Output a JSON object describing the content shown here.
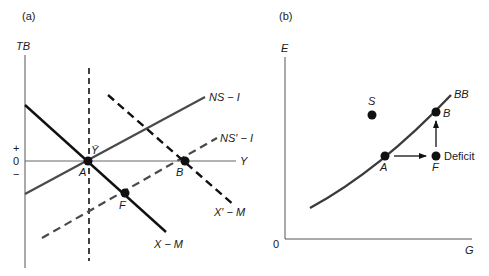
{
  "panel_a": {
    "label": "(a)",
    "y_axis_label": "TB",
    "x_axis_label": "Y",
    "tick_plus": "+",
    "tick_zero": "0",
    "tick_minus": "−",
    "ybar_label": "Ȳ",
    "curves": {
      "ns_i": "NS − I",
      "ns_prime_i": "NS′ − I",
      "x_m": "X − M",
      "x_prime_m": "X′ − M"
    },
    "points": {
      "a": "A",
      "b": "B",
      "f": "F"
    }
  },
  "panel_b": {
    "label": "(b)",
    "y_axis_label": "E",
    "x_axis_label": "G",
    "origin": "0",
    "curve": "BB",
    "points": {
      "s": "S",
      "a": "A",
      "b": "B",
      "f": "F"
    },
    "deficit_label": "Deficit"
  },
  "colors": {
    "axis": "#555555",
    "solid_curve": "#111111",
    "gray_curve": "#4a4a4a",
    "dashed": "#111111"
  }
}
